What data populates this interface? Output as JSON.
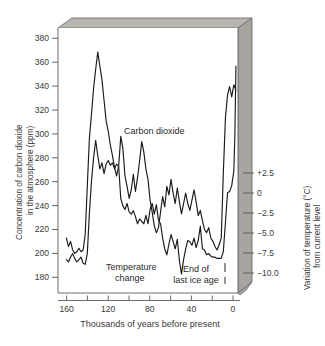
{
  "figure": {
    "title": "",
    "bottom_caption": "Thousands of years before present",
    "left_axis_title": "Concentration of carbon dioxide in the atmosphere (ppm)",
    "right_axis_title": "Variation of temperature (°C) from current level",
    "annotations": {
      "co2": "Carbon dioxide",
      "temp_line1": "Temperature",
      "temp_line2": "change",
      "ice_line1": "End of",
      "ice_line2": "last ice age"
    },
    "colors": {
      "curve": "#1a1a1a",
      "frame": "#6f6f6f",
      "slab_top": "#b9b6b1",
      "slab_side": "#a8a5a0",
      "plot_bg": "#ffffff",
      "text": "#3a3a3a"
    }
  },
  "chart_data": {
    "type": "line",
    "title": "",
    "xlabel": "Thousands of years before present",
    "ylabel": "Concentration of carbon dioxide in the atmosphere (ppm)",
    "y2label": "Variation of temperature (°C) from current level",
    "xlim": [
      170,
      -2
    ],
    "x_reversed": true,
    "ylim": [
      168,
      390
    ],
    "y2lim": [
      -11.8,
      3.6
    ],
    "grid": false,
    "legend": "none (in-plot labels)",
    "xticks_major": [
      160,
      120,
      80,
      40,
      0
    ],
    "xticks_minor": [
      140,
      100,
      60,
      20
    ],
    "yticks_left": [
      180,
      200,
      220,
      240,
      260,
      280,
      300,
      320,
      340,
      360,
      380
    ],
    "yticks_right": [
      2.5,
      0,
      -2.5,
      -5.0,
      -7.5,
      -10.0
    ],
    "yticks_right_labels": [
      "+2.5",
      "0",
      "−2.5",
      "−5.0",
      "−7.5",
      "−10.0"
    ],
    "series": [
      {
        "name": "Carbon dioxide",
        "unit": "ppm",
        "axis": "left",
        "x": [
          162,
          160,
          158,
          156,
          154,
          152,
          150,
          148,
          146,
          144,
          142,
          140,
          138,
          136,
          134,
          132,
          130,
          128,
          126,
          124,
          122,
          120,
          118,
          116,
          114,
          112,
          110,
          108,
          106,
          104,
          102,
          100,
          98,
          96,
          94,
          92,
          90,
          88,
          86,
          84,
          82,
          80,
          78,
          76,
          74,
          72,
          70,
          68,
          66,
          64,
          62,
          60,
          58,
          56,
          54,
          52,
          50,
          48,
          46,
          44,
          42,
          40,
          38,
          36,
          34,
          32,
          30,
          28,
          26,
          24,
          22,
          20,
          18,
          16,
          14,
          12,
          10,
          8,
          6,
          4,
          2,
          1,
          0
        ],
        "values": [
          196,
          194,
          198,
          201,
          197,
          194,
          196,
          198,
          193,
          192,
          201,
          235,
          262,
          281,
          296,
          283,
          272,
          277,
          268,
          276,
          279,
          275,
          277,
          272,
          276,
          274,
          247,
          241,
          238,
          243,
          236,
          234,
          237,
          232,
          226,
          230,
          228,
          226,
          233,
          226,
          238,
          243,
          234,
          242,
          229,
          226,
          214,
          205,
          200,
          209,
          217,
          211,
          205,
          213,
          195,
          184,
          196,
          205,
          212,
          211,
          208,
          214,
          206,
          212,
          224,
          205,
          204,
          200,
          201,
          199,
          198,
          198,
          197,
          197,
          197,
          203,
          227,
          252,
          253,
          258,
          270,
          300,
          358
        ]
      },
      {
        "name": "Temperature change",
        "unit": "°C",
        "axis": "right",
        "x": [
          162,
          160,
          158,
          156,
          154,
          152,
          150,
          148,
          146,
          144,
          142,
          140,
          138,
          136,
          134,
          132,
          130,
          128,
          126,
          124,
          122,
          120,
          118,
          116,
          114,
          112,
          110,
          108,
          106,
          104,
          102,
          100,
          98,
          96,
          94,
          92,
          90,
          88,
          86,
          84,
          82,
          80,
          78,
          76,
          74,
          72,
          70,
          68,
          66,
          64,
          62,
          60,
          58,
          56,
          54,
          52,
          50,
          48,
          46,
          44,
          42,
          40,
          38,
          36,
          34,
          32,
          30,
          28,
          26,
          24,
          22,
          20,
          18,
          16,
          14,
          12,
          10,
          8,
          6,
          4,
          2,
          0
        ],
        "values": [
          -8.6,
          -9.1,
          -8.8,
          -9.3,
          -9.5,
          -9.4,
          -9.2,
          -9.4,
          -9.3,
          -8.4,
          -5.6,
          -2.8,
          -1.4,
          0.1,
          1.2,
          2.2,
          1.4,
          0.6,
          -0.6,
          -1.8,
          -2.4,
          -3.2,
          -3.8,
          -4.5,
          -5.0,
          -4.4,
          -2.7,
          -3.4,
          -5.0,
          -5.6,
          -6.3,
          -5.8,
          -4.9,
          -5.9,
          -5.1,
          -4.1,
          -3.0,
          -3.6,
          -4.6,
          -5.2,
          -6.4,
          -7.1,
          -7.9,
          -8.3,
          -8.0,
          -7.1,
          -6.2,
          -6.8,
          -5.6,
          -6.1,
          -5.2,
          -6.0,
          -6.6,
          -5.7,
          -6.5,
          -7.2,
          -6.6,
          -6.0,
          -6.6,
          -7.0,
          -6.4,
          -5.8,
          -6.5,
          -7.3,
          -7.0,
          -7.6,
          -8.1,
          -8.3,
          -8.0,
          -8.6,
          -8.8,
          -9.1,
          -9.3,
          -9.0,
          -8.6,
          -4.8,
          -1.6,
          -0.3,
          0.2,
          -0.4,
          0.3,
          0.0
        ]
      }
    ],
    "annotations": [
      {
        "text": "Carbon dioxide",
        "x": 108,
        "y": 272
      },
      {
        "text": "Temperature change",
        "x": 128,
        "y": 177
      },
      {
        "text": "End of last ice age",
        "x": 28,
        "y": 174
      }
    ]
  }
}
